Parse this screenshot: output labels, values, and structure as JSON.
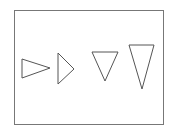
{
  "diagram": {
    "stroke_color": "#555555",
    "frame_color": "#777777",
    "frame": {
      "x": 14,
      "y": 10,
      "width": 149,
      "height": 114
    },
    "shapes": [
      {
        "name": "triangle-right-wide",
        "direction": "right",
        "points": "22,59 50,68 22,78"
      },
      {
        "name": "triangle-right-narrow",
        "direction": "right",
        "points": "58,53 74,69 58,84"
      },
      {
        "name": "triangle-down-short",
        "direction": "down",
        "points": "92,52 118,52 105,81"
      },
      {
        "name": "triangle-down-tall",
        "direction": "down",
        "points": "129,45 154,45 142,89"
      }
    ]
  }
}
